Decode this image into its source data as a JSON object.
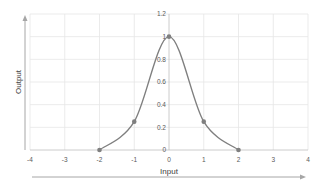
{
  "chart_data": {
    "type": "line",
    "title": "",
    "xlabel": "Input",
    "ylabel": "Output",
    "xlim": [
      -4,
      4
    ],
    "ylim": [
      0,
      1.2
    ],
    "grid": true,
    "legend": null,
    "x_ticks": [
      "-4",
      "-3",
      "-2",
      "-1",
      "0",
      "1",
      "2",
      "3",
      "4"
    ],
    "y_ticks": [
      "0",
      "0.2",
      "0.4",
      "0.6",
      "0.8",
      "1",
      "1.2"
    ],
    "series": [
      {
        "name": "Output",
        "markers": {
          "x": [
            -2,
            -1,
            0,
            1,
            2
          ],
          "y": [
            0,
            0.25,
            1,
            0.25,
            0
          ]
        },
        "curve_note": "smooth bell-shaped curve through markers"
      }
    ],
    "colors": {
      "line": "#7f7f7f",
      "marker": "#7f7f7f",
      "grid": "#e6e6e6",
      "arrow": "#a6a6a6"
    }
  }
}
